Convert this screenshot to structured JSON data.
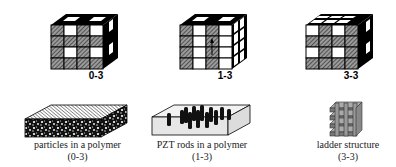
{
  "figure": {
    "top_row": [
      {
        "label": "0-3",
        "type": "cube-0-3"
      },
      {
        "label": "1-3",
        "type": "cube-1-3"
      },
      {
        "label": "3-3",
        "type": "cube-3-3"
      }
    ],
    "bottom_row": [
      {
        "caption_line1": "particles in a polymer",
        "caption_line2": "(0-3)"
      },
      {
        "caption_line1": "PZT rods in a polymer",
        "caption_line2": "(1-3)"
      },
      {
        "caption_line1": "ladder structure",
        "caption_line2": "(3-3)"
      }
    ]
  },
  "colors": {
    "ink": "#000000",
    "hatch_bg": "#7a7a7a",
    "white": "#ffffff",
    "slab_face": "#e8e8e8",
    "ladder": "#8c8c8c"
  }
}
